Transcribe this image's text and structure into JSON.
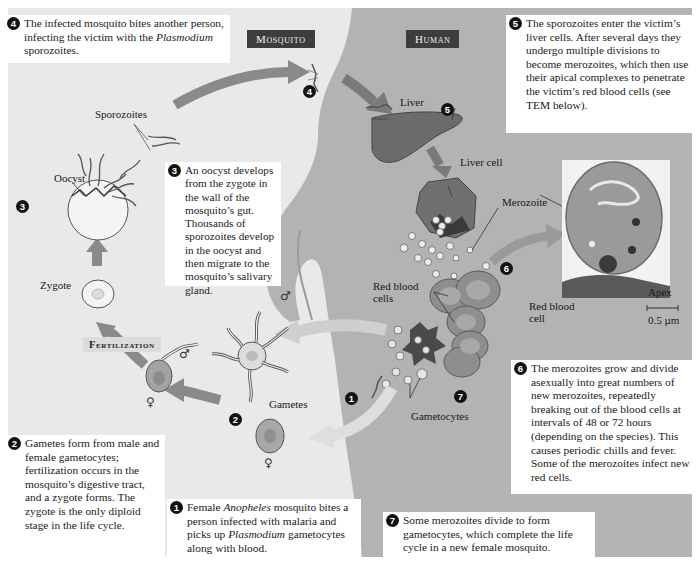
{
  "headers": {
    "mosquito": "Mosquito",
    "human": "Human",
    "fertilization": "Fertilization"
  },
  "steps": [
    {
      "n": "1",
      "text_before": "Female ",
      "italic": "Anopheles",
      "text_after": " mosquito bites a person infected with malaria and picks up ",
      "italic2": "Plasmodium",
      "text_end": " gametocytes along with blood."
    },
    {
      "n": "2",
      "text": "Gametes form from male and female gametocytes; fertilization occurs in the mosquito’s digestive tract, and a zygote forms. The zygote is the only diploid stage in the life cycle."
    },
    {
      "n": "3",
      "text": "An oocyst develops from the zygote in the wall of the mosquito’s gut. Thousands of sporozoites develop in the oocyst and then migrate to the mosquito’s salivary gland."
    },
    {
      "n": "4",
      "text_before": "The infected mosquito bites another person, infecting the victim with the ",
      "italic": "Plasmodium",
      "text_after": " sporozoites."
    },
    {
      "n": "5",
      "text": "The sporozoites enter the victim’s liver cells. After several days they undergo multiple divisions to become merozoites, which then use their apical complexes to penetrate the victim’s red blood cells (see TEM below)."
    },
    {
      "n": "6",
      "text": "The merozoites grow and divide asexually into great numbers of new merozoites, repeatedly breaking out of the blood cells at intervals of 48 or 72 hours (depending on the species). This causes periodic chills and fever. Some of the merozoites infect new red cells."
    },
    {
      "n": "7",
      "text": "Some merozoites divide to form gametocytes, which complete the life cycle in a new female mosquito."
    }
  ],
  "labels": {
    "sporozoites": "Sporozoites",
    "oocyst": "Oocyst",
    "zygote": "Zygote",
    "gametes": "Gametes",
    "liver": "Liver",
    "liver_cell": "Liver cell",
    "merozoite": "Merozoite",
    "red_blood_cells": "Red blood cells",
    "gametocytes": "Gametocytes",
    "apex": "Apex",
    "red_blood_cell": "Red blood cell",
    "scale": "0.5 µm",
    "male_symbol": "♂",
    "female_symbol": "♀"
  },
  "colors": {
    "panel_bg": "#e9e9e9",
    "human_body": "#b3b3b3",
    "arrow": "#8a8a8a",
    "header_bg": "#3d3d3d"
  }
}
